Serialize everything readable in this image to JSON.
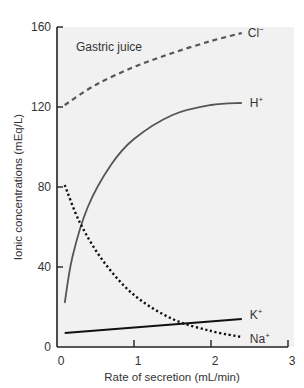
{
  "chart_data": {
    "type": "line",
    "title": "",
    "annotation": "Gastric juice",
    "xlabel": "Rate of secretion (mL/min)",
    "ylabel": "Ionic concentrations (mEq/L)",
    "xlim": [
      0,
      3
    ],
    "ylim": [
      0,
      160
    ],
    "xticks": [
      0,
      1,
      2,
      3
    ],
    "yticks": [
      0,
      40,
      80,
      120,
      160
    ],
    "grid": false,
    "legend": "inline labels at line ends",
    "series": [
      {
        "name": "Cl⁻",
        "label": "Cl",
        "sup": "−",
        "style": "dashed",
        "color": "#555555",
        "x": [
          0.1,
          0.5,
          1.0,
          1.5,
          2.0,
          2.4
        ],
        "y": [
          121,
          131,
          140,
          147,
          153,
          157
        ]
      },
      {
        "name": "H⁺",
        "label": "H",
        "sup": "+",
        "style": "solid",
        "color": "#555555",
        "x": [
          0.1,
          0.2,
          0.4,
          0.7,
          1.0,
          1.5,
          2.0,
          2.4
        ],
        "y": [
          22,
          45,
          70,
          91,
          104,
          116,
          121,
          122
        ]
      },
      {
        "name": "Na⁺",
        "label": "Na",
        "sup": "+",
        "style": "dotted",
        "color": "#111111",
        "x": [
          0.1,
          0.3,
          0.6,
          1.0,
          1.5,
          2.0,
          2.4
        ],
        "y": [
          81,
          62,
          43,
          26,
          14,
          8,
          5
        ]
      },
      {
        "name": "K⁺",
        "label": "K",
        "sup": "+",
        "style": "solid",
        "color": "#111111",
        "x": [
          0.1,
          2.4
        ],
        "y": [
          7,
          14
        ]
      }
    ]
  },
  "colors": {
    "plot_background": "#f1f1f1",
    "axis": "#222222"
  }
}
